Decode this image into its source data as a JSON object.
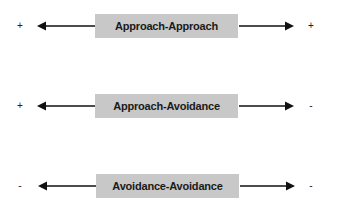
{
  "diagram": {
    "type": "conflict-types",
    "rows": [
      {
        "label": "Approach-Approach",
        "left_sign": "+",
        "right_sign": "+"
      },
      {
        "label": "Approach-Avoidance",
        "left_sign": "+",
        "right_sign": "-"
      },
      {
        "label": "Avoidance-Avoidance",
        "left_sign": "-",
        "right_sign": "-"
      }
    ],
    "colors": {
      "box": "#c8c8c8",
      "arrow": "#111111",
      "text": "#1a1a1a"
    }
  }
}
